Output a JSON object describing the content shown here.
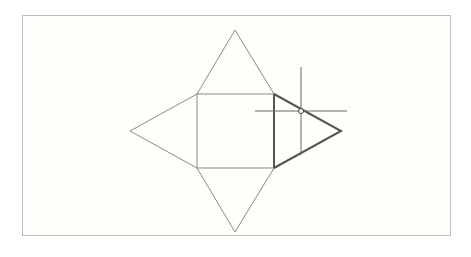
{
  "canvas": {
    "background": "#fefefb",
    "frame_color": "#bdbdbd"
  },
  "net": {
    "description": "Square pyramid net: central square with four triangular faces",
    "line_color": "#8a8a8a",
    "highlight_color": "#555555",
    "square": {
      "x1": 197,
      "y1": 94,
      "x2": 274,
      "y2": 168
    },
    "triangles": [
      {
        "name": "top",
        "points": "197,94 235,30 274,94",
        "highlighted": false
      },
      {
        "name": "left",
        "points": "197,94 130,131 197,168",
        "highlighted": false
      },
      {
        "name": "bottom",
        "points": "197,168 235,232 274,168",
        "highlighted": false
      },
      {
        "name": "right",
        "points": "274,94 341,131 274,168",
        "highlighted": true
      }
    ]
  },
  "cursor": {
    "type": "crosshair",
    "x": 301,
    "y": 111,
    "vertical": {
      "y1": 67,
      "y2": 155
    },
    "horizontal": {
      "x1": 255,
      "x2": 347
    },
    "color": "#6b6b55"
  }
}
